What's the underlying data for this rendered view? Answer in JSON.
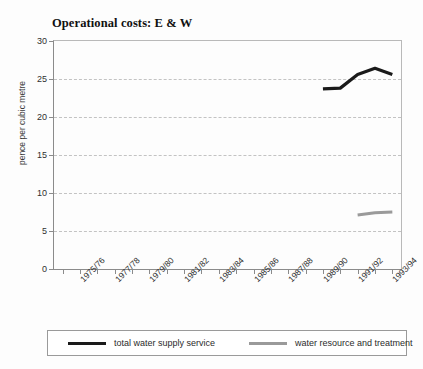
{
  "chart_data": {
    "type": "line",
    "title": "Operational costs: E & W",
    "xlabel": "",
    "ylabel": "pence per cubic metre",
    "ylim": [
      0,
      30
    ],
    "yticks": [
      0,
      5,
      10,
      15,
      20,
      25,
      30
    ],
    "grid": true,
    "legend_position": "bottom",
    "categories": [
      "1974/75",
      "1975/76",
      "1976/77",
      "1977/78",
      "1978/79",
      "1979/80",
      "1980/81",
      "1981/82",
      "1982/83",
      "1983/84",
      "1984/85",
      "1985/86",
      "1986/87",
      "1987/88",
      "1988/89",
      "1989/90",
      "1990/91",
      "1991/92",
      "1992/93",
      "1993/94"
    ],
    "xtick_labels": [
      "1975/76",
      "1977/78",
      "1979/80",
      "1981/82",
      "1983/84",
      "1985/86",
      "1987/88",
      "1989/90",
      "1991/92",
      "1993/94"
    ],
    "series": [
      {
        "name": "total water supply service",
        "color": "#1a1a1a",
        "x": [
          "1989/90",
          "1990/91",
          "1991/92",
          "1992/93",
          "1993/94"
        ],
        "values": [
          23.7,
          23.8,
          25.6,
          26.4,
          25.6
        ]
      },
      {
        "name": "water resource and treatment",
        "color": "#9a9a9a",
        "x": [
          "1991/92",
          "1992/93",
          "1993/94"
        ],
        "values": [
          7.1,
          7.4,
          7.5
        ]
      }
    ]
  },
  "legend": {
    "items": [
      {
        "label": "total water supply service",
        "color": "#1a1a1a"
      },
      {
        "label": "water resource and treatment",
        "color": "#9a9a9a"
      }
    ]
  }
}
